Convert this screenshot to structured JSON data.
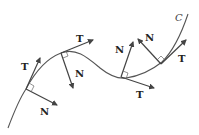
{
  "figure": {
    "curve_label": "C",
    "points": [
      {
        "tangent_label": "T",
        "normal_label": "N"
      },
      {
        "tangent_label": "T",
        "normal_label": "N"
      },
      {
        "tangent_label": "T",
        "normal_label": "N"
      },
      {
        "tangent_label": "T",
        "normal_label": "N"
      }
    ],
    "colors": {
      "curve": "#555555",
      "vectors": "#444444",
      "labels": "#222222"
    }
  }
}
